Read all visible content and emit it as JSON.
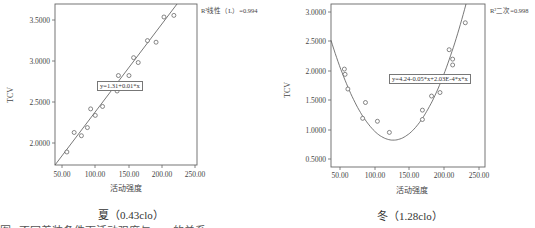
{
  "chart_data": [
    {
      "type": "scatter",
      "title": "夏（0.43clo）",
      "xlabel": "活动强度",
      "ylabel": "TCV",
      "xlim": [
        40,
        255
      ],
      "ylim": [
        1.72,
        3.7
      ],
      "x_ticks": [
        "50.00",
        "100.00",
        "150.00",
        "200.00",
        "250.00"
      ],
      "y_ticks": [
        "2.0000",
        "2.5000",
        "3.0000",
        "3.5000"
      ],
      "grid": false,
      "fit": {
        "type": "linear",
        "equation": "y=1.31+0.01*x",
        "r2_label": "R²线性（L）=0.994"
      },
      "points": [
        [
          58,
          1.88
        ],
        [
          69,
          2.12
        ],
        [
          80,
          2.08
        ],
        [
          89,
          2.18
        ],
        [
          94,
          2.41
        ],
        [
          101,
          2.33
        ],
        [
          112,
          2.44
        ],
        [
          134,
          2.63
        ],
        [
          136,
          2.82
        ],
        [
          152,
          2.82
        ],
        [
          159,
          3.04
        ],
        [
          166,
          2.98
        ],
        [
          180,
          3.25
        ],
        [
          193,
          3.23
        ],
        [
          205,
          3.54
        ],
        [
          220,
          3.56
        ]
      ]
    },
    {
      "type": "scatter",
      "title": "冬（1.28clo）",
      "xlabel": "活动强度",
      "ylabel": "TCV",
      "xlim": [
        37,
        256
      ],
      "ylim": [
        0.36,
        3.14
      ],
      "x_ticks": [
        "50.00",
        "100.00",
        "150.00",
        "200.00",
        "250.00"
      ],
      "y_ticks": [
        "0.5000",
        "1.0000",
        "1.5000",
        "2.0000",
        "2.5000",
        "3.0000"
      ],
      "grid": false,
      "fit": {
        "type": "quadratic",
        "equation": "y=4.24-0.05*x+2.03E-4*x*x",
        "r2_label": "R²二次=0.998"
      },
      "points": [
        [
          56,
          2.03
        ],
        [
          57,
          1.94
        ],
        [
          61,
          1.69
        ],
        [
          82,
          1.19
        ],
        [
          86,
          1.46
        ],
        [
          103,
          1.14
        ],
        [
          120,
          0.95
        ],
        [
          167,
          1.17
        ],
        [
          167,
          1.33
        ],
        [
          180,
          1.57
        ],
        [
          192,
          1.63
        ],
        [
          205,
          2.36
        ],
        [
          210,
          2.2
        ],
        [
          210,
          2.1
        ],
        [
          228,
          2.82
        ]
      ]
    }
  ],
  "left": {
    "y_ticks": [
      "3.5000",
      "3.0000",
      "2.5000",
      "2.0000"
    ],
    "x_ticks": [
      "50.00",
      "100.00",
      "150.00",
      "200.00",
      "250.00"
    ],
    "xlabel": "活动强度",
    "ylabel": "TCV",
    "equation": "y=1.31+0.01*x",
    "r2": "R²线性（L）=0.994",
    "caption": "夏（0.43clo）"
  },
  "right": {
    "y_ticks": [
      "3.0000",
      "2.5000",
      "2.0000",
      "1.5000",
      "1.0000",
      "0.5000"
    ],
    "x_ticks": [
      "50.00",
      "100.00",
      "150.00",
      "200.00",
      "250.00"
    ],
    "xlabel": "活动强度",
    "ylabel": "TCV",
    "equation": "y=4.24-0.05*x+2.03E-4*x*x",
    "r2": "R²二次=0.998",
    "caption": "冬（1.28clo）"
  },
  "figure_caption": "图1  不同着装条件下活动强度与TCV的关系"
}
